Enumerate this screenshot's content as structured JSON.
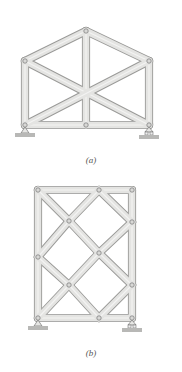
{
  "figures": [
    {
      "id": "a",
      "caption": "(a)",
      "description": "Pin-jointed gable truss with X-bracing, pin support at left, roller support at right",
      "joints": [
        {
          "name": "bottom-left",
          "x": 25,
          "y": 125
        },
        {
          "name": "bottom-middle",
          "x": 86,
          "y": 125
        },
        {
          "name": "bottom-right",
          "x": 149,
          "y": 125
        },
        {
          "name": "top-left",
          "x": 25,
          "y": 61
        },
        {
          "name": "apex",
          "x": 86,
          "y": 31
        },
        {
          "name": "top-right",
          "x": 149,
          "y": 61
        }
      ],
      "members": [
        [
          "bottom-left",
          "bottom-middle"
        ],
        [
          "bottom-middle",
          "bottom-right"
        ],
        [
          "bottom-left",
          "top-left"
        ],
        [
          "bottom-right",
          "top-right"
        ],
        [
          "top-left",
          "apex"
        ],
        [
          "apex",
          "top-right"
        ],
        [
          "apex",
          "bottom-middle"
        ],
        [
          "top-left",
          "bottom-right"
        ],
        [
          "top-right",
          "bottom-left"
        ]
      ],
      "supports": [
        {
          "type": "pin",
          "at": "bottom-left"
        },
        {
          "type": "roller",
          "at": "bottom-right"
        }
      ]
    },
    {
      "id": "b",
      "caption": "(b)",
      "description": "Rectangular pin-jointed frame with diagonal lattice bracing, pin support at left, roller support at right",
      "joints": [
        {
          "name": "top-left",
          "x": 38,
          "y": 190
        },
        {
          "name": "top-middle",
          "x": 99,
          "y": 190
        },
        {
          "name": "top-right",
          "x": 132,
          "y": 190
        },
        {
          "name": "right-upper",
          "x": 132,
          "y": 222
        },
        {
          "name": "left-middle",
          "x": 38,
          "y": 257
        },
        {
          "name": "right-lower",
          "x": 132,
          "y": 285
        },
        {
          "name": "bottom-left",
          "x": 38,
          "y": 318
        },
        {
          "name": "bottom-middle",
          "x": 99,
          "y": 318
        },
        {
          "name": "bottom-right",
          "x": 132,
          "y": 318
        },
        {
          "name": "inner-upper",
          "x": 69,
          "y": 221
        },
        {
          "name": "inner-center",
          "x": 99,
          "y": 253
        },
        {
          "name": "inner-lower",
          "x": 69,
          "y": 285
        }
      ],
      "members": [
        [
          "top-left",
          "top-middle"
        ],
        [
          "top-middle",
          "top-right"
        ],
        [
          "bottom-left",
          "bottom-middle"
        ],
        [
          "bottom-middle",
          "bottom-right"
        ],
        [
          "top-left",
          "left-middle"
        ],
        [
          "left-middle",
          "bottom-left"
        ],
        [
          "top-right",
          "right-upper"
        ],
        [
          "right-upper",
          "right-lower"
        ],
        [
          "right-lower",
          "bottom-right"
        ],
        [
          "top-left",
          "inner-upper"
        ],
        [
          "inner-upper",
          "inner-center"
        ],
        [
          "inner-center",
          "right-lower"
        ],
        [
          "top-middle",
          "inner-upper"
        ],
        [
          "inner-upper",
          "left-middle"
        ],
        [
          "top-middle",
          "right-upper"
        ],
        [
          "right-upper",
          "inner-center"
        ],
        [
          "inner-center",
          "inner-lower"
        ],
        [
          "inner-lower",
          "bottom-left"
        ],
        [
          "left-middle",
          "inner-lower"
        ],
        [
          "inner-lower",
          "bottom-middle"
        ],
        [
          "bottom-middle",
          "right-lower"
        ]
      ],
      "supports": [
        {
          "type": "pin",
          "at": "bottom-left"
        },
        {
          "type": "roller",
          "at": "bottom-right"
        }
      ]
    }
  ],
  "colors": {
    "member_fill": "#e4e4e2",
    "member_edge": "#9a9a98",
    "pin_fill": "#d8d8d6",
    "ground": "#b8b8b6",
    "caption": "#555555"
  }
}
